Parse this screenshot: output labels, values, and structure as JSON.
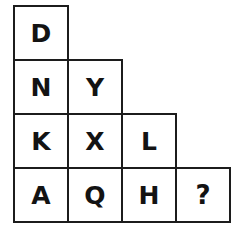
{
  "puzzle": {
    "type": "letter-sequence-staircase-grid",
    "shape": "right-triangle-staircase",
    "unknown_marker": "?",
    "colors": {
      "background": "#ffffff",
      "cell_fill": "#ffffff",
      "border": "#1c1c1c",
      "text": "#131313"
    },
    "rows": [
      {
        "index": 1,
        "cells": [
          {
            "label": "D",
            "unknown": false
          }
        ]
      },
      {
        "index": 2,
        "cells": [
          {
            "label": "N",
            "unknown": false
          },
          {
            "label": "Y",
            "unknown": false
          }
        ]
      },
      {
        "index": 3,
        "cells": [
          {
            "label": "K",
            "unknown": false
          },
          {
            "label": "X",
            "unknown": false
          },
          {
            "label": "L",
            "unknown": false
          }
        ]
      },
      {
        "index": 4,
        "cells": [
          {
            "label": "A",
            "unknown": false
          },
          {
            "label": "Q",
            "unknown": false
          },
          {
            "label": "H",
            "unknown": false
          },
          {
            "label": "?",
            "unknown": true
          }
        ]
      }
    ]
  }
}
